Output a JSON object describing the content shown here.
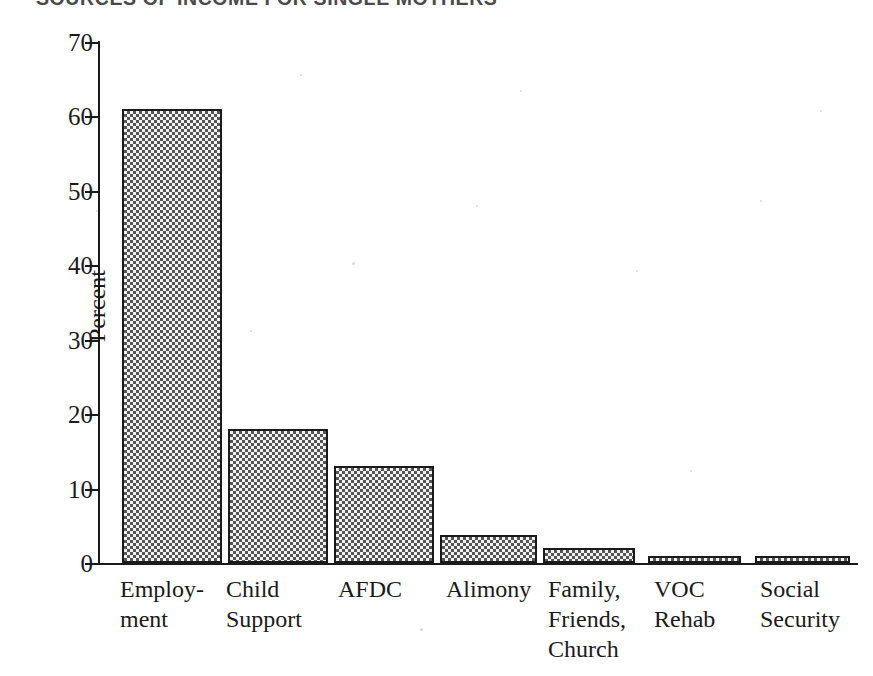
{
  "chart_data": {
    "type": "bar",
    "title": "SOURCES OF INCOME FOR SINGLE MOTHERS",
    "xlabel": "",
    "ylabel": "Percent",
    "ylim": [
      0,
      70
    ],
    "yticks": [
      0,
      10,
      20,
      30,
      40,
      50,
      60,
      70
    ],
    "ytick_labels": [
      "0",
      "10",
      "20",
      "30",
      "40",
      "50",
      "60",
      "70"
    ],
    "grid": false,
    "legend": null,
    "categories": [
      "Employ-\nment",
      "Child\nSupport",
      "AFDC",
      "Alimony",
      "Family,\nFriends,\nChurch",
      "VOC\nRehab",
      "Social\nSecurity"
    ],
    "values": [
      61,
      18,
      13,
      3.8,
      2,
      1,
      0.9
    ],
    "bar_fill": "#f2f2f2",
    "bar_edge": "#1a1a1a",
    "axis_color": "#1a1a1a",
    "background": "#ffffff"
  },
  "axis": {
    "y_title": "Percent"
  }
}
